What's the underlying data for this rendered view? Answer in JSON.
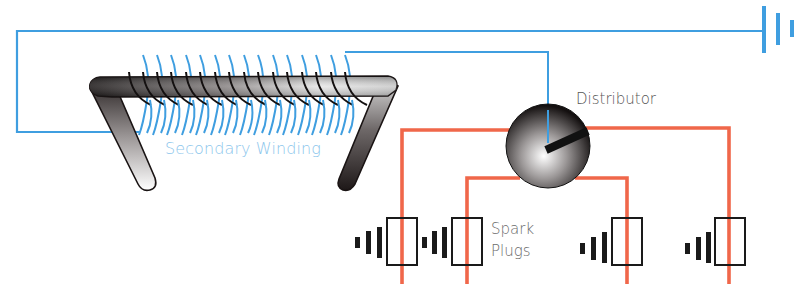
{
  "diagram": {
    "labels": {
      "secondary_winding": "Secondary Winding",
      "distributor": "Distributor",
      "spark_plugs_line1": "Spark",
      "spark_plugs_line2": "Plugs"
    },
    "components": [
      {
        "id": "battery",
        "type": "battery-symbol"
      },
      {
        "id": "ignition-coil",
        "type": "coil-core",
        "winding_turns": 16
      },
      {
        "id": "distributor",
        "type": "rotor"
      },
      {
        "id": "spark-plug-1",
        "type": "spark-plug"
      },
      {
        "id": "spark-plug-2",
        "type": "spark-plug"
      },
      {
        "id": "spark-plug-3",
        "type": "spark-plug"
      },
      {
        "id": "spark-plug-4",
        "type": "spark-plug"
      }
    ],
    "colors": {
      "primary_wire": "#3f9ee0",
      "high_tension_wire": "#f0674a",
      "core_dark": "#1e1a1a",
      "core_light": "#f2f2f2",
      "plug_outline": "#1a1a1a",
      "secondary_label": "#8cc6ec",
      "text_gray": "#555555"
    }
  }
}
